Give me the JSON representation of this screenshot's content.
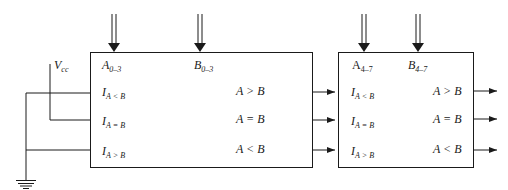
{
  "diagram": {
    "type": "cascaded 4-bit magnitude comparators (8-bit comparison)",
    "supply": {
      "label": "V",
      "sub": "cc"
    },
    "ground": {
      "label": "ground"
    },
    "comparators": [
      {
        "id": "low",
        "inputs_top": [
          {
            "label": "A",
            "sub": "0–3"
          },
          {
            "label": "B",
            "sub": "0–3"
          }
        ],
        "cascade_inputs": [
          {
            "label": "I",
            "sub": "A < B"
          },
          {
            "label": "I",
            "sub": "A = B"
          },
          {
            "label": "I",
            "sub": "A > B"
          }
        ],
        "outputs": [
          {
            "label": "A > B"
          },
          {
            "label": "A = B"
          },
          {
            "label": "A < B"
          }
        ]
      },
      {
        "id": "high",
        "inputs_top": [
          {
            "label": "A",
            "sub": "4–7"
          },
          {
            "label": "B",
            "sub": "4–7"
          }
        ],
        "cascade_inputs": [
          {
            "label": "I",
            "sub": "A < B"
          },
          {
            "label": "I",
            "sub": "A = B"
          },
          {
            "label": "I",
            "sub": "A > B"
          }
        ],
        "outputs": [
          {
            "label": "A > B"
          },
          {
            "label": "A = B"
          },
          {
            "label": "A < B"
          }
        ]
      }
    ],
    "colors": {
      "line": "#1a1a1a",
      "background": "#ffffff"
    }
  }
}
